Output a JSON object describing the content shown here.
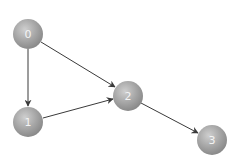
{
  "diagram": {
    "type": "directed-graph",
    "colors": {
      "node_light": "#c8c8c8",
      "node_mid": "#a4a4a4",
      "node_dark": "#8a8a8a",
      "edge": "#3a3a3a",
      "label": "#f4f4f4"
    },
    "nodes": [
      {
        "id": "0",
        "label": "0",
        "x": 28,
        "y": 34
      },
      {
        "id": "1",
        "label": "1",
        "x": 28,
        "y": 122
      },
      {
        "id": "2",
        "label": "2",
        "x": 128,
        "y": 96
      },
      {
        "id": "3",
        "label": "3",
        "x": 212,
        "y": 140
      }
    ],
    "edges": [
      {
        "from": "0",
        "to": "1"
      },
      {
        "from": "0",
        "to": "2"
      },
      {
        "from": "1",
        "to": "2"
      },
      {
        "from": "2",
        "to": "3"
      }
    ]
  }
}
